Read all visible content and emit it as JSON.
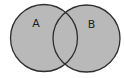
{
  "diagram": {
    "type": "venn",
    "sets": [
      {
        "id": "A",
        "label": "A",
        "shaded": true
      },
      {
        "id": "B",
        "label": "B",
        "shaded": true
      }
    ],
    "shaded_region": "A ∪ B",
    "colors": {
      "fill": "#b9b9b9",
      "stroke": "#2e2e2e",
      "background": "#ffffff",
      "label": "#1e1e1e"
    }
  }
}
